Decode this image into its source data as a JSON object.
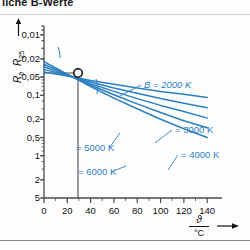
{
  "caption": "liche B-Werte",
  "axes": {
    "y_label_num": "R",
    "y_label_num_sub": "ϑ",
    "y_label_den": "R",
    "y_label_den_sub": "25",
    "x_label_num": "ϑ",
    "x_label_den": "°C",
    "y_ticks": [
      "5",
      "2",
      "1",
      "0,5",
      "0,2",
      "0,1",
      "0,05",
      "0,02",
      "0,01"
    ],
    "x_ticks": [
      "0",
      "20",
      "40",
      "60",
      "80",
      "100",
      "120",
      "140"
    ]
  },
  "colors": {
    "curve": "#2b7fc4",
    "axis": "#4a4a4a",
    "text": "#111111",
    "frame": "#999999"
  },
  "annotations": {
    "reference_point": "25 °C, 1",
    "b2000": "B = 2000 K",
    "b3000": "= 3000 K",
    "b4000": "= 4000 K",
    "b5000": "= 5000 K",
    "b6000": "= 6000 K"
  },
  "chart_data": {
    "type": "line",
    "title": "liche B-Werte",
    "xlabel": "ϑ / °C",
    "ylabel": "Rϑ / R25",
    "xlim": [
      0,
      145
    ],
    "ylim": [
      0.01,
      7
    ],
    "yscale": "log",
    "xscale": "linear",
    "grid": false,
    "legend": "inline-labels",
    "x_ticks": [
      0,
      20,
      40,
      60,
      80,
      100,
      120,
      140
    ],
    "y_ticks": [
      0.01,
      0.02,
      0.05,
      0.1,
      0.2,
      0.5,
      1,
      2,
      5
    ],
    "reference_point": {
      "x": 25,
      "y": 1,
      "marker": "open-circle"
    },
    "series": [
      {
        "name": "B = 2000 K",
        "B": 2000,
        "x": [
          0,
          20,
          40,
          60,
          80,
          100,
          120,
          140
        ],
        "values": [
          1.21,
          1.04,
          0.88,
          0.76,
          0.66,
          0.58,
          0.52,
          0.46
        ]
      },
      {
        "name": "B = 3000 K",
        "B": 3000,
        "x": [
          0,
          20,
          40,
          60,
          80,
          100,
          120,
          140
        ],
        "values": [
          1.34,
          1.06,
          0.83,
          0.66,
          0.54,
          0.44,
          0.37,
          0.31
        ]
      },
      {
        "name": "B = 4000 K",
        "B": 4000,
        "x": [
          0,
          20,
          40,
          60,
          80,
          100,
          120,
          140
        ],
        "values": [
          1.48,
          1.08,
          0.78,
          0.58,
          0.44,
          0.34,
          0.27,
          0.21
        ]
      },
      {
        "name": "B = 5000 K",
        "B": 5000,
        "x": [
          0,
          20,
          40,
          60,
          80,
          100,
          120,
          140
        ],
        "values": [
          1.63,
          1.1,
          0.74,
          0.51,
          0.36,
          0.26,
          0.19,
          0.145
        ]
      },
      {
        "name": "B = 6000 K",
        "B": 6000,
        "x": [
          0,
          20,
          40,
          60,
          80,
          100,
          120,
          140
        ],
        "values": [
          1.8,
          1.12,
          0.7,
          0.45,
          0.3,
          0.2,
          0.14,
          0.1
        ]
      }
    ]
  }
}
